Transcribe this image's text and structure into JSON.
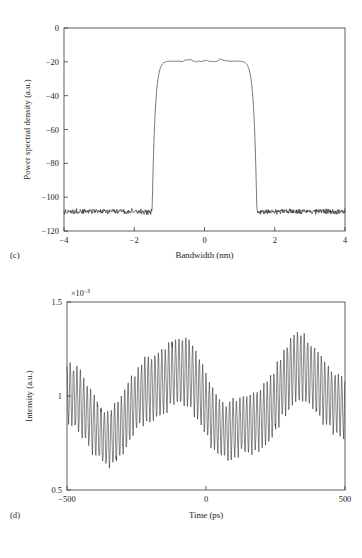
{
  "figure": {
    "background": "#ffffff",
    "trace_color": "#262626",
    "axis_color": "#3a3a3a",
    "text_color": "#1a1a1a"
  },
  "panels": [
    {
      "letter": "(c)",
      "id": "panel-c"
    },
    {
      "letter": "(d)",
      "id": "panel-d"
    }
  ],
  "chart_data": [
    {
      "type": "line",
      "panel": "(c)",
      "title": "",
      "xlabel": "Bandwidth (nm)",
      "ylabel": "Power spectral density (a.u.)",
      "xlim": [
        -4,
        4
      ],
      "ylim": [
        -120,
        0
      ],
      "xticks": [
        -4,
        -2,
        0,
        2,
        4
      ],
      "xticklabels": [
        "−4",
        "−2",
        "0",
        "2",
        "4"
      ],
      "yticks": [
        -120,
        -100,
        -80,
        -60,
        -40,
        -20,
        0
      ],
      "yticklabels": [
        "−120",
        "−100",
        "−80",
        "−60",
        "−40",
        "−20",
        "0"
      ],
      "grid": false,
      "legend": null,
      "exponent_label": null,
      "series": [
        {
          "name": "optical spectrum",
          "shape": "flat-top-supergaussian",
          "noise_floor_db": -108.3,
          "plateau_db": -19.6,
          "plateau_half_width_nm": 0.62,
          "edge_half_width_nm": 2.1,
          "supergaussian_order": 9,
          "noise_amplitude_db": 0.85,
          "plateau_ripple_db": 0.8,
          "samples": 760,
          "description": "Flat-topped spectrum: plateau near -20 dB between -0.6 and +0.6 nm, steep skirts falling to a -108 dB noise floor beyond about +/-2.2 nm",
          "key_points": [
            {
              "x": -4.0,
              "y": -108.3
            },
            {
              "x": -3.0,
              "y": -108.0
            },
            {
              "x": -2.4,
              "y": -107.2
            },
            {
              "x": -2.2,
              "y": -104.0
            },
            {
              "x": -2.0,
              "y": -96.0
            },
            {
              "x": -1.8,
              "y": -86.0
            },
            {
              "x": -1.6,
              "y": -76.0
            },
            {
              "x": -1.4,
              "y": -66.0
            },
            {
              "x": -1.2,
              "y": -56.0
            },
            {
              "x": -1.0,
              "y": -46.0
            },
            {
              "x": -0.85,
              "y": -37.0
            },
            {
              "x": -0.75,
              "y": -30.0
            },
            {
              "x": -0.68,
              "y": -24.0
            },
            {
              "x": -0.6,
              "y": -20.4
            },
            {
              "x": -0.45,
              "y": -18.9
            },
            {
              "x": -0.3,
              "y": -19.8
            },
            {
              "x": -0.1,
              "y": -20.2
            },
            {
              "x": 0.1,
              "y": -19.9
            },
            {
              "x": 0.3,
              "y": -20.1
            },
            {
              "x": 0.45,
              "y": -19.0
            },
            {
              "x": 0.6,
              "y": -20.3
            },
            {
              "x": 0.68,
              "y": -24.0
            },
            {
              "x": 0.78,
              "y": -31.0
            },
            {
              "x": 0.9,
              "y": -39.0
            },
            {
              "x": 1.1,
              "y": -50.0
            },
            {
              "x": 1.3,
              "y": -60.0
            },
            {
              "x": 1.5,
              "y": -70.0
            },
            {
              "x": 1.7,
              "y": -80.0
            },
            {
              "x": 1.9,
              "y": -90.0
            },
            {
              "x": 2.1,
              "y": -100.0
            },
            {
              "x": 2.3,
              "y": -106.0
            },
            {
              "x": 2.6,
              "y": -107.6
            },
            {
              "x": 3.2,
              "y": -108.2
            },
            {
              "x": 4.0,
              "y": -108.4
            }
          ]
        }
      ]
    },
    {
      "type": "line",
      "panel": "(d)",
      "title": "",
      "xlabel": "Time (ps)",
      "ylabel": "Intensity (a.u.)",
      "xlim": [
        -500,
        500
      ],
      "ylim": [
        0.5,
        1.5
      ],
      "xticks": [
        -500,
        0,
        500
      ],
      "xticklabels": [
        "−500",
        "0",
        "500"
      ],
      "yticks": [
        0.5,
        1,
        1.5
      ],
      "yticklabels": [
        "0.5",
        "1",
        "1.5"
      ],
      "grid": false,
      "legend": null,
      "exponent_label": "×10",
      "exponent_power": "−3",
      "y_scale_factor": 0.001,
      "series": [
        {
          "name": "interference intensity",
          "shape": "fast-fringe-with-slow-envelope",
          "mean_level": 0.97,
          "fringe_period_ps": 12.2,
          "fringe_amplitude": 0.175,
          "envelope_period_ps": 470,
          "envelope_amplitude": 0.16,
          "envelope_phase_ps": -120,
          "secondary_envelope_amplitude": 0.035,
          "secondary_envelope_period_ps": 193,
          "amplitude_noise": 0.045,
          "samples": 1040,
          "description": "Fast sinusoidal fringes of about 12 ps period modulated by a slow envelope with maxima near -120 ps and +350 ps and minima near -420 ps and +120 ps",
          "envelope_extrema": [
            {
              "x": -420,
              "type": "min",
              "y": 0.72
            },
            {
              "x": -120,
              "type": "max",
              "y": 1.2
            },
            {
              "x": 120,
              "type": "min",
              "y": 0.7
            },
            {
              "x": 350,
              "type": "max",
              "y": 1.27
            }
          ],
          "observed_peak_max": 1.45,
          "observed_peak_min": 0.53
        }
      ]
    }
  ]
}
